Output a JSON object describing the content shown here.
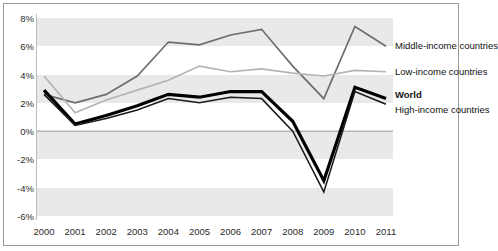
{
  "chart_data": {
    "type": "line",
    "title": "",
    "subtitle": "",
    "xlabel": "",
    "ylabel": "",
    "categories": [
      "2000",
      "2001",
      "2002",
      "2003",
      "2004",
      "2005",
      "2006",
      "2007",
      "2008",
      "2009",
      "2010",
      "2011"
    ],
    "x": [
      2000,
      2001,
      2002,
      2003,
      2004,
      2005,
      2006,
      2007,
      2008,
      2009,
      2010,
      2011
    ],
    "ylim": [
      -6,
      8
    ],
    "ytick_labels": [
      "8%",
      "6%",
      "4%",
      "2%",
      "0%",
      "-2%",
      "-4%",
      "-6%"
    ],
    "ytick_values": [
      8,
      6,
      4,
      2,
      0,
      -2,
      -4,
      -6
    ],
    "grid": "horizontal-bands",
    "legend_position": "right-inline",
    "series": [
      {
        "name": "Middle-income countries",
        "color": "#6e6e6e",
        "width": 1.7,
        "values": [
          2.6,
          2.0,
          2.6,
          3.9,
          6.3,
          6.1,
          6.8,
          7.2,
          4.6,
          2.3,
          7.4,
          6.0
        ]
      },
      {
        "name": "Low-income countries",
        "color": "#b4b4b4",
        "width": 1.7,
        "values": [
          3.9,
          1.3,
          2.2,
          2.9,
          3.6,
          4.6,
          4.2,
          4.4,
          4.1,
          3.9,
          4.3,
          4.2
        ]
      },
      {
        "name": "World",
        "color": "#000000",
        "width": 3.2,
        "values": [
          2.9,
          0.5,
          1.1,
          1.8,
          2.6,
          2.4,
          2.8,
          2.8,
          0.7,
          -3.5,
          3.1,
          2.3
        ]
      },
      {
        "name": "High-income countries",
        "color": "#1a1a1a",
        "width": 1.5,
        "values": [
          2.6,
          0.4,
          0.9,
          1.5,
          2.3,
          2.0,
          2.4,
          2.3,
          0.0,
          -4.3,
          2.8,
          1.9
        ]
      }
    ],
    "legend": [
      {
        "label": "Middle-income countries",
        "bold": false
      },
      {
        "label": "Low-income countries",
        "bold": false
      },
      {
        "label": "World",
        "bold": true
      },
      {
        "label": "High-income countries",
        "bold": false
      }
    ],
    "colors": {
      "band": "#e9e9e9",
      "axis": "#bdbdbd",
      "border": "#9a9a9a",
      "zero_line": "#8c8c8c",
      "text": "#2b2b2b"
    }
  }
}
